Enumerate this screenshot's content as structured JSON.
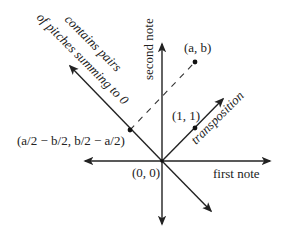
{
  "diagram": {
    "origin": {
      "label": "(0, 0)",
      "x": 162,
      "y": 161
    },
    "axes": {
      "horizontal": {
        "label": "first note",
        "x1": 83,
        "x2": 272,
        "y": 161
      },
      "vertical": {
        "label": "second note",
        "x": 162,
        "y1": 42,
        "y2": 226
      }
    },
    "transposition": {
      "label": "transposition",
      "tip_x": 225,
      "tip_y": 97
    },
    "anti_diagonal": {
      "label_line1": "contains pairs",
      "label_line2": "of pitches summing to 0",
      "tip_x": 68,
      "tip_y": 64,
      "end_x": 213,
      "end_y": 213
    },
    "points": [
      {
        "name": "a-b-point",
        "label": "(a, b)",
        "x": 195,
        "y": 62
      },
      {
        "name": "one-one-point",
        "label": "(1, 1)",
        "x": 195,
        "y": 128
      },
      {
        "name": "projection-point",
        "label": "(a/2 − b/2, b/2 − a/2)",
        "x": 130,
        "y": 130
      }
    ],
    "colors": {
      "line": "#222222",
      "dashed": "#333333",
      "background": "#ffffff"
    }
  }
}
